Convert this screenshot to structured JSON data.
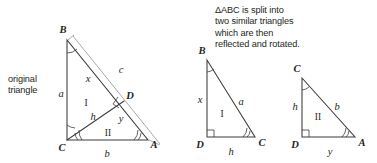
{
  "captions": {
    "original": [
      "original",
      "triangle"
    ],
    "split": [
      "ΔABC is split into",
      "two similar triangles",
      "which are then",
      "reflected and rotated."
    ]
  },
  "figures": {
    "original_triangle": {
      "name": "original triangle ABC with altitude CD",
      "vertices": {
        "B": "B",
        "C": "C",
        "A": "A",
        "D": "D"
      },
      "side_labels": {
        "a": "a",
        "b": "b",
        "c": "c",
        "x": "x",
        "y": "y",
        "h": "h"
      },
      "region_labels": {
        "upper": "I",
        "lower": "II"
      }
    },
    "triangle_one": {
      "name": "triangle I reflected",
      "vertices": {
        "B": "B",
        "D": "D",
        "C": "C"
      },
      "side_labels": {
        "x": "x",
        "a": "a",
        "h": "h"
      },
      "region_labels": {
        "interior": "I"
      }
    },
    "triangle_two": {
      "name": "triangle II rotated",
      "vertices": {
        "C": "C",
        "D": "D",
        "A": "A"
      },
      "side_labels": {
        "h": "h",
        "b": "b",
        "y": "y"
      },
      "region_labels": {
        "interior": "II"
      }
    }
  },
  "colors": {
    "background": "#ffffff",
    "ink": "#231f20",
    "triangle_stroke": "#3b3b3b",
    "thin_stroke": "#9a9a9a"
  }
}
